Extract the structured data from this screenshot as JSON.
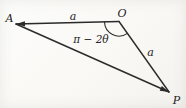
{
  "figure": {
    "type": "geometry-triangle-diagram",
    "stroke_color": "#2b2b2b",
    "text_color": "#222222",
    "labels": {
      "vertex_a": "A",
      "vertex_o": "O",
      "vertex_p": "P",
      "side_ao": "a",
      "side_op": "a",
      "angle_at_o": "π − 2θ"
    }
  }
}
